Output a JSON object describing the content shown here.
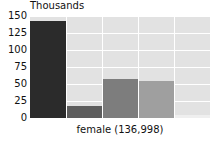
{
  "chart_data": {
    "type": "bar",
    "title": "Thousands",
    "xlabel": "female (136,998)",
    "ylabel": "",
    "categories": [
      "1",
      "2",
      "3",
      "4",
      "5"
    ],
    "values": [
      143,
      17,
      57,
      54,
      4
    ],
    "ylim": [
      0,
      150
    ],
    "yticks": [
      0,
      25,
      50,
      75,
      100,
      125,
      150
    ],
    "ytick_labels": [
      "0",
      "25",
      "50",
      "75",
      "100",
      "125",
      "150"
    ],
    "grid": true,
    "legend": "none",
    "bar_colors": [
      "#2b2b2b",
      "#5e5e5e",
      "#7d7d7d",
      "#9f9f9f",
      "#efefef"
    ],
    "plot_background": "#e2e2e2",
    "gridline_color": "#ffffff",
    "text_color": "#111111"
  }
}
